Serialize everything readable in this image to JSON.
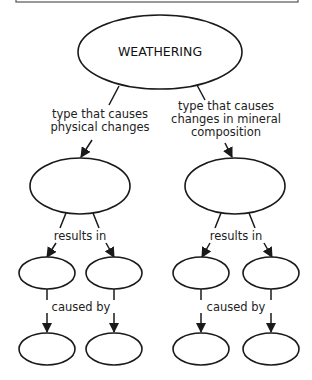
{
  "diagram": {
    "colors": {
      "stroke": "#1a1a1a",
      "text": "#222222",
      "background": "#ffffff",
      "top_box_border": "#555555"
    },
    "root": {
      "label": "WEATHERING"
    },
    "branches": [
      {
        "link_label_lines": [
          "type that causes",
          "physical changes"
        ],
        "node_label": "",
        "sub_link_label": "results in",
        "children": [
          {
            "label": ""
          },
          {
            "label": ""
          }
        ],
        "cause_link_label": "caused by",
        "causes": [
          {
            "label": ""
          },
          {
            "label": ""
          }
        ]
      },
      {
        "link_label_lines": [
          "type that causes",
          "changes in mineral",
          "composition"
        ],
        "node_label": "",
        "sub_link_label": "results in",
        "children": [
          {
            "label": ""
          },
          {
            "label": ""
          }
        ],
        "cause_link_label": "caused by",
        "causes": [
          {
            "label": ""
          },
          {
            "label": ""
          }
        ]
      }
    ]
  }
}
